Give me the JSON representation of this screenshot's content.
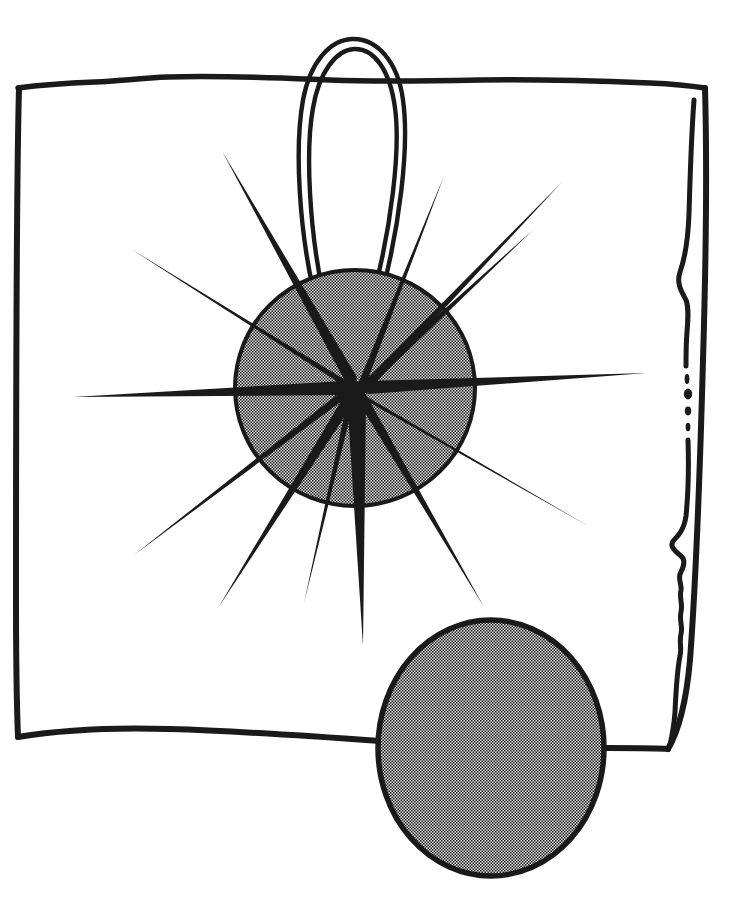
{
  "image": {
    "title": "Hatpin with Starburst Ornament and Plain Disc",
    "medium": "pen-and-ink line drawing with halftone stipple shading",
    "width": 730,
    "height": 907,
    "background_color": "#ffffff",
    "ink_color": "#1a1a1a",
    "halftone_light": "#d8d8d8",
    "halftone_dark": "#1c1c1c",
    "halftone_effective_gray": "#7a7a7a"
  },
  "elements": {
    "frame": {
      "name": "Hand-drawn rectangular sheet border",
      "stroke_width": 5,
      "corners": {
        "top_left": [
          17,
          88
        ],
        "top_right": [
          705,
          88
        ],
        "bottom_right": [
          668,
          748
        ],
        "bottom_left": [
          17,
          737
        ]
      },
      "top_edge_note": "slightly wavy, dips gently toward center",
      "bottom_edge_note": "bows downward, passes behind the lower disc",
      "right_edge_note": "double line: outer contour plus an inner wavy torn/fold line, broken into dots near mid-height"
    },
    "wire_loop": {
      "name": "Pin wire loop",
      "description": "Tall narrow double-stroke hairpin loop rising above the sheet's top edge",
      "apex": [
        350,
        38
      ],
      "left_foot": [
        318,
        289
      ],
      "right_foot": [
        382,
        289
      ],
      "max_width": 100,
      "stroke_width": 4,
      "crosses_frame_top": true
    },
    "starburst": {
      "name": "Starburst ornament",
      "center": [
        355,
        388
      ],
      "disc_radius_x": 120,
      "disc_radius_y": 118,
      "disc_fill": "halftone",
      "disc_outline_width": 4,
      "ray_count": 13,
      "ray_shape": "tapered spike, wide at hub and narrowing to a fine point",
      "rays": [
        {
          "index": 0,
          "angle_deg": 0,
          "length": 292,
          "hub_width": 13,
          "label": "east-ray"
        },
        {
          "index": 1,
          "angle_deg": 180,
          "length": 283,
          "hub_width": 13,
          "label": "west-ray"
        },
        {
          "index": 2,
          "angle_deg": 90,
          "length": 258,
          "hub_width": 14,
          "label": "south-ray"
        },
        {
          "index": 3,
          "angle_deg": 248,
          "length": 250,
          "hub_width": 13,
          "label": "north-northwest-ray"
        },
        {
          "index": 4,
          "angle_deg": 289,
          "length": 236,
          "hub_width": 13,
          "label": "north-northeast-ray"
        },
        {
          "index": 5,
          "angle_deg": 317,
          "length": 248,
          "hub_width": 13,
          "label": "northeast-ray"
        },
        {
          "index": 6,
          "angle_deg": 208,
          "length": 245,
          "hub_width": 13,
          "label": "northwest-ray"
        },
        {
          "index": 7,
          "angle_deg": 152,
          "length": 243,
          "hub_width": 13,
          "label": "southwest-ray"
        },
        {
          "index": 8,
          "angle_deg": 120,
          "length": 252,
          "hub_width": 13,
          "label": "south-southwest-ray"
        },
        {
          "index": 9,
          "angle_deg": 62,
          "length": 248,
          "hub_width": 13,
          "label": "south-southeast-ray"
        },
        {
          "index": 10,
          "angle_deg": 33,
          "length": 243,
          "hub_width": 13,
          "label": "southeast-ray"
        },
        {
          "index": 11,
          "angle_deg": 339,
          "length": 190,
          "hub_width": 11,
          "label": "east-northeast-ray"
        },
        {
          "index": 12,
          "angle_deg": 101,
          "length": 220,
          "hub_width": 11,
          "label": "south-ray-b"
        }
      ]
    },
    "lower_disc": {
      "name": "Lower plain disc",
      "center": [
        491,
        748
      ],
      "radius_x": 112,
      "radius_y": 128,
      "fill": "halftone",
      "outline_width": 5,
      "overlaps_frame_bottom_edge": true,
      "extends_below_frame": true
    }
  },
  "caption": "Ink drawing of a starburst hatpin head with thirteen tapered rays on a stippled disc, a wire loop above, and a second stippled disc at lower right."
}
